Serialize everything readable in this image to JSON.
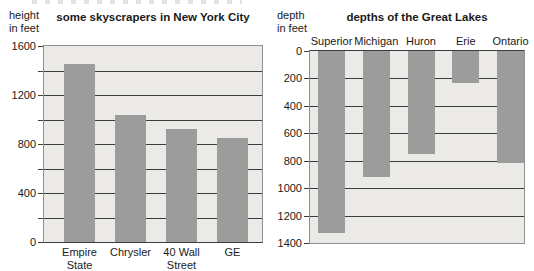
{
  "colors": {
    "bar": "#9c9c9c",
    "plot_background": "#ebeae7",
    "gridline": "#3c3c3c",
    "frame": "#8f8f8f",
    "text": "#1a1a1a",
    "page_background": "#ffffff"
  },
  "chart_data": [
    {
      "type": "bar",
      "title": "some skyscrapers in New York City",
      "ylabel": "height in feet",
      "ylabel_lines": "height\nin feet",
      "categories": [
        "Empire State",
        "Chrysler",
        "40 Wall Street",
        "GE"
      ],
      "category_labels": [
        "Empire\nState",
        "Chrysler",
        "40 Wall\nStreet",
        "GE"
      ],
      "values": [
        1450,
        1040,
        925,
        850
      ],
      "ylim": [
        0,
        1600
      ],
      "ytick_step": 200,
      "ytick_labels": [
        0,
        400,
        800,
        1200,
        1600
      ],
      "orientation": "up",
      "grid": true,
      "category_label_position": "below"
    },
    {
      "type": "bar",
      "title": "depths of the Great Lakes",
      "ylabel": "depth in feet",
      "ylabel_lines": "depth\nin feet",
      "categories": [
        "Superior",
        "Michigan",
        "Huron",
        "Erie",
        "Ontario"
      ],
      "category_labels": [
        "Superior",
        "Michigan",
        "Huron",
        "Erie",
        "Ontario"
      ],
      "values": [
        1330,
        920,
        750,
        230,
        820
      ],
      "ylim": [
        0,
        1400
      ],
      "ytick_step": 200,
      "ytick_labels": [
        0,
        200,
        400,
        600,
        800,
        1000,
        1200,
        1400
      ],
      "orientation": "down",
      "grid": true,
      "category_label_position": "above"
    }
  ]
}
